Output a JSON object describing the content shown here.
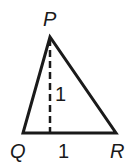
{
  "diagram": {
    "type": "triangle",
    "vertices": {
      "P": {
        "label": "P",
        "x": 50,
        "y": 37
      },
      "Q": {
        "label": "Q",
        "x": 23,
        "y": 133
      },
      "R": {
        "label": "R",
        "x": 116,
        "y": 133
      }
    },
    "altitude": {
      "from": "P",
      "to_base": "QR",
      "label": "1",
      "style": "dashed"
    },
    "base": {
      "segment": "QR",
      "label": "1"
    },
    "stroke_color": "#1a1a1a"
  }
}
